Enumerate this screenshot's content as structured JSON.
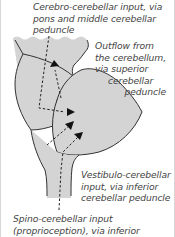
{
  "diagram": {
    "type": "anatomical-schematic",
    "colors": {
      "tissue_fill": "#d4d4d4",
      "outline": "#333333",
      "arrows": "#222222",
      "text": "#444444",
      "background": "#ffffff"
    },
    "labels": {
      "cerebro_input": {
        "lines": [
          "Cerebro-cerebellar input, via",
          "pons and middle cerebellar",
          "peduncle"
        ]
      },
      "outflow": {
        "lines": [
          "Outflow from",
          "the cerebellum,",
          "via superior",
          "cerebellar",
          "peduncle"
        ]
      },
      "vestibulo_input": {
        "lines": [
          "Vestibulo-cerebellar",
          "input, via inferior",
          "cerebellar peduncle"
        ]
      },
      "spino_input": {
        "lines": [
          "Spino-cerebellar input",
          "(proprioception), via inferior"
        ]
      }
    },
    "arrows": [
      {
        "name": "outflow-arrow",
        "direction": "up"
      },
      {
        "name": "cerebro-input-arrow",
        "direction": "right"
      },
      {
        "name": "vestibulo-input-arrow",
        "direction": "up-right"
      },
      {
        "name": "spino-input-arrow",
        "direction": "up-right"
      }
    ]
  }
}
